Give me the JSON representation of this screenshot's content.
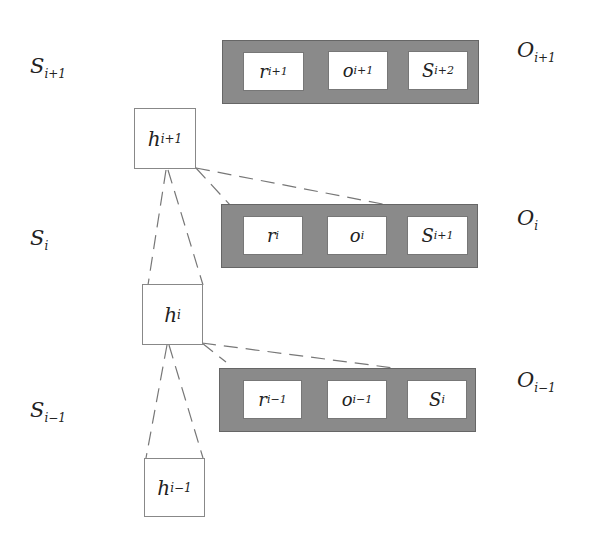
{
  "diagram": {
    "rows": [
      {
        "state_label": "S",
        "state_sub": "i+1",
        "output_label": "O",
        "output_sub": "i+1",
        "cells": [
          {
            "main": "r",
            "sub": "i+1"
          },
          {
            "main": "o",
            "sub": "i+1"
          },
          {
            "main": "S",
            "sub": "i+2"
          }
        ]
      },
      {
        "state_label": "S",
        "state_sub": "i",
        "output_label": "O",
        "output_sub": "i",
        "cells": [
          {
            "main": "r",
            "sub": "i"
          },
          {
            "main": "o",
            "sub": "i"
          },
          {
            "main": "S",
            "sub": "i+1"
          }
        ]
      },
      {
        "state_label": "S",
        "state_sub": "i-1",
        "output_label": "O",
        "output_sub": "i-1",
        "cells": [
          {
            "main": "r",
            "sub": "i-1"
          },
          {
            "main": "o",
            "sub": "i-1"
          },
          {
            "main": "S",
            "sub": "i"
          }
        ]
      }
    ],
    "hidden_nodes": [
      {
        "main": "h",
        "sub": "i+1"
      },
      {
        "main": "h",
        "sub": "i"
      },
      {
        "main": "h",
        "sub": "i-1"
      }
    ],
    "colors": {
      "bar": "#8a8a8a",
      "cell": "#ffffff",
      "line": "#777777"
    }
  }
}
